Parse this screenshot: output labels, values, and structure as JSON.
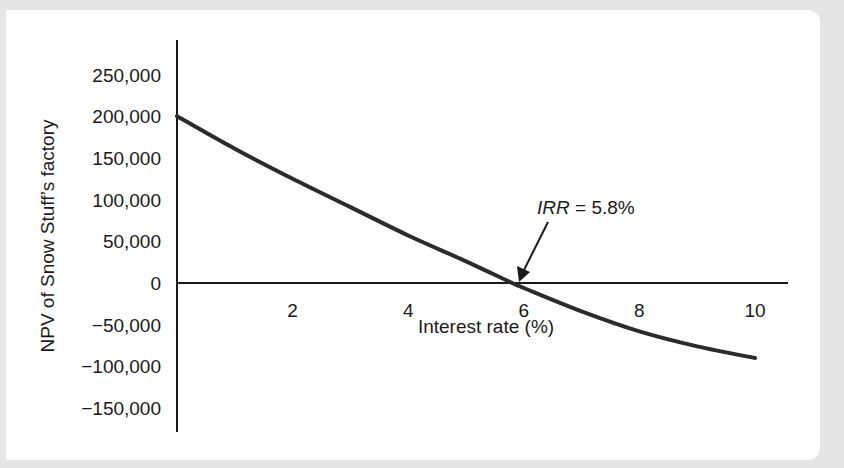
{
  "chart_data": {
    "type": "line",
    "title": "",
    "xlabel": "Interest rate (%)",
    "ylabel": "NPV of Snow Stuff’s factory",
    "xlim": [
      0,
      10
    ],
    "ylim": [
      -150000,
      250000
    ],
    "grid": false,
    "legend": null,
    "x_ticks": [
      2,
      4,
      6,
      8,
      10
    ],
    "x_tick_labels": [
      "2",
      "4",
      "6",
      "8",
      "10"
    ],
    "y_ticks": [
      250000,
      200000,
      150000,
      100000,
      50000,
      0,
      -50000,
      -100000,
      -150000
    ],
    "y_tick_labels": [
      "250,000",
      "200,000",
      "150,000",
      "100,000",
      "50,000",
      "0",
      "−50,000",
      "−100,000",
      "−150,000"
    ],
    "series": [
      {
        "name": "NPV",
        "x": [
          0,
          1,
          2,
          3,
          4,
          5,
          5.8,
          6,
          7,
          8,
          9,
          10
        ],
        "y": [
          200000,
          161000,
          125000,
          91000,
          57000,
          26000,
          0,
          -6000,
          -34000,
          -58000,
          -76000,
          -90000
        ]
      }
    ],
    "annotations": [
      {
        "text_italic": "IRR",
        "text": " = 5.8%",
        "x": 5.8,
        "y": 0,
        "arrow": true
      }
    ]
  },
  "axes": {
    "xlabel": "Interest rate (%)",
    "ylabel": "NPV of Snow Stuff’s factory"
  },
  "annotation": {
    "italic": "IRR",
    "rest": " = 5.8%"
  },
  "colors": {
    "line": "#2b2b2b",
    "axis": "#1a1a1a",
    "background": "#e6e6e6",
    "panel": "#ffffff"
  }
}
